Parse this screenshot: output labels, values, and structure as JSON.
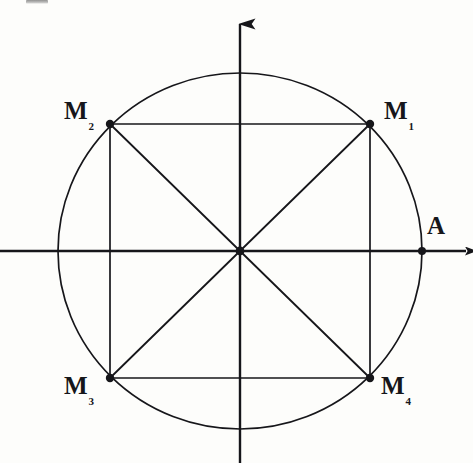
{
  "figure": {
    "type": "geometry-diagram",
    "canvas": {
      "width": 473,
      "height": 463,
      "background": "#fdfdfb"
    },
    "stroke_color": "#16161a",
    "stroke_width": 1.6,
    "origin": {
      "x": 240,
      "y": 251,
      "label": ""
    },
    "circle": {
      "cx": 240,
      "cy": 251,
      "rx": 182,
      "ry": 178
    },
    "axes": {
      "x_axis": {
        "x1": 0,
        "y1": 251,
        "x2": 472,
        "y2": 251,
        "arrow": "right"
      },
      "y_axis": {
        "x1": 240,
        "y1": 463,
        "x2": 240,
        "y2": 10,
        "arrow": "up"
      }
    },
    "points": [
      {
        "id": "M1",
        "label": "M",
        "subscript": "1",
        "x": 370,
        "y": 124,
        "marker": "filled-dot",
        "label_pos": "upper-right"
      },
      {
        "id": "M2",
        "label": "M",
        "subscript": "2",
        "x": 110,
        "y": 124,
        "marker": "filled-dot",
        "label_pos": "upper-left"
      },
      {
        "id": "M3",
        "label": "M",
        "subscript": "3",
        "x": 110,
        "y": 378,
        "marker": "filled-dot",
        "label_pos": "lower-left"
      },
      {
        "id": "M4",
        "label": "M",
        "subscript": "4",
        "x": 370,
        "y": 378,
        "marker": "filled-dot",
        "label_pos": "lower-right"
      },
      {
        "id": "A",
        "label": "A",
        "subscript": "",
        "x": 422,
        "y": 251,
        "marker": "filled-dot",
        "label_pos": "upper-right"
      },
      {
        "id": "O",
        "label": "",
        "subscript": "",
        "x": 240,
        "y": 251,
        "marker": "filled-dot",
        "label_pos": "none"
      }
    ],
    "segments": [
      {
        "name": "side-M2-M1",
        "x1": 110,
        "y1": 124,
        "x2": 370,
        "y2": 124
      },
      {
        "name": "side-M1-M4",
        "x1": 370,
        "y1": 124,
        "x2": 370,
        "y2": 378
      },
      {
        "name": "side-M4-M3",
        "x1": 370,
        "y1": 378,
        "x2": 110,
        "y2": 378
      },
      {
        "name": "side-M3-M2",
        "x1": 110,
        "y1": 378,
        "x2": 110,
        "y2": 124
      },
      {
        "name": "diagonal-M2-M4",
        "x1": 110,
        "y1": 124,
        "x2": 370,
        "y2": 378
      },
      {
        "name": "diagonal-M1-M3",
        "x1": 370,
        "y1": 124,
        "x2": 110,
        "y2": 378
      }
    ],
    "labels": {
      "M1": {
        "text": "M",
        "sub": "1"
      },
      "M2": {
        "text": "M",
        "sub": "2"
      },
      "M3": {
        "text": "M",
        "sub": "3"
      },
      "M4": {
        "text": "M",
        "sub": "4"
      },
      "A": {
        "text": "A",
        "sub": ""
      }
    }
  }
}
